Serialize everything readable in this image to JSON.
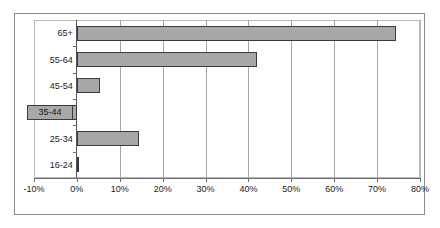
{
  "chart_data": {
    "type": "bar",
    "orientation": "horizontal",
    "title": "",
    "xlabel": "",
    "ylabel": "",
    "categories": [
      "16-24",
      "25-34",
      "35-44",
      "45-54",
      "55-64",
      "65+"
    ],
    "values": [
      0.5,
      14.5,
      -9.2,
      5.3,
      42.0,
      74.5
    ],
    "value_unit": "%",
    "xlim": [
      -10,
      80
    ],
    "xticks": [
      -10,
      0,
      10,
      20,
      30,
      40,
      50,
      60,
      70,
      80
    ],
    "xticklabels": [
      "-10%",
      "0%",
      "10%",
      "20%",
      "30%",
      "40%",
      "50%",
      "60%",
      "70%",
      "80%"
    ],
    "grid": "vertical",
    "legend": "none",
    "series": [
      {
        "name": "",
        "points": [
          {
            "category": "65+",
            "value": 74.5
          },
          {
            "category": "55-64",
            "value": 42.0
          },
          {
            "category": "45-54",
            "value": 5.3
          },
          {
            "category": "35-44",
            "value": -9.2
          },
          {
            "category": "25-34",
            "value": 14.5
          },
          {
            "category": "16-24",
            "value": 0.5
          }
        ]
      }
    ],
    "colors": {
      "bar_fill": "#a8a8a8",
      "bar_border": "#3b3b3b",
      "gridline": "#a5a5a5",
      "zero_line": "#555555",
      "axis": "#6d6d6d",
      "frame": "#8a8a8a",
      "text": "#1a1a1a",
      "background": "#ffffff"
    }
  }
}
